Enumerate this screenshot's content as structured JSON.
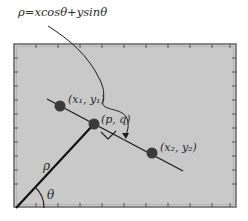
{
  "equation": {
    "text": "ρ=xcosθ+ysinθ"
  },
  "labels": {
    "point1": "(x₁, y₁)",
    "point_pq": "(p, q)",
    "point2": "(x₂, y₂)",
    "rho": "ρ",
    "theta": "θ"
  },
  "colors": {
    "background": "#ffffff",
    "panel_fill": "#c9c9c9",
    "panel_border": "#6e6e6e",
    "line": "#1e1e1e",
    "point": "#3a3a3a",
    "text": "#2a2a2a"
  },
  "geometry": {
    "panel": {
      "x": 14,
      "y": 44,
      "w": 222,
      "h": 163
    },
    "origin": {
      "x": 16,
      "y": 208
    },
    "foot_pq": {
      "x": 94,
      "y": 124
    },
    "line_start": {
      "x": 47,
      "y": 99
    },
    "line_end": {
      "x": 183,
      "y": 171
    },
    "point1": {
      "x": 60,
      "y": 106
    },
    "point2": {
      "x": 152,
      "y": 153
    }
  }
}
